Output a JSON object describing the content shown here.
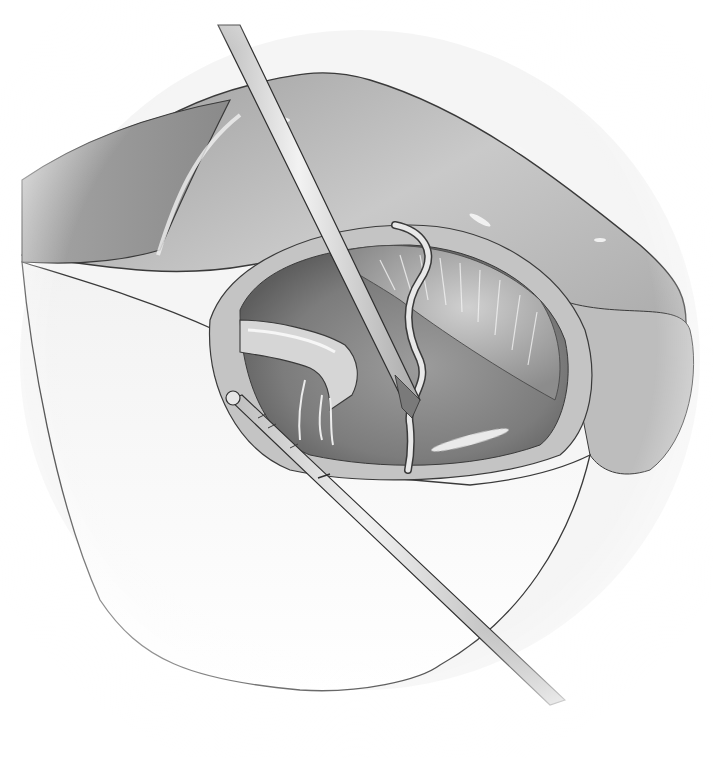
{
  "illustration": {
    "kind": "grayscale surgical illustration",
    "palette": {
      "background": "#ffffff",
      "outline": "#3a3a3a",
      "tissue_light": "#d8d8d8",
      "tissue_mid": "#a8a8a8",
      "tissue_dark": "#6e6e6e",
      "cavity_dark": "#7a7a7a",
      "highlight": "#f4f4f4",
      "instrument": "#e2e2e2"
    },
    "elements": [
      "retracted-tissue-flap-upper",
      "skin-drape-lower",
      "surgical-cavity",
      "upper-instrument-shaft",
      "lower-probe-instrument",
      "curved-vessel",
      "tubular-structure"
    ]
  }
}
